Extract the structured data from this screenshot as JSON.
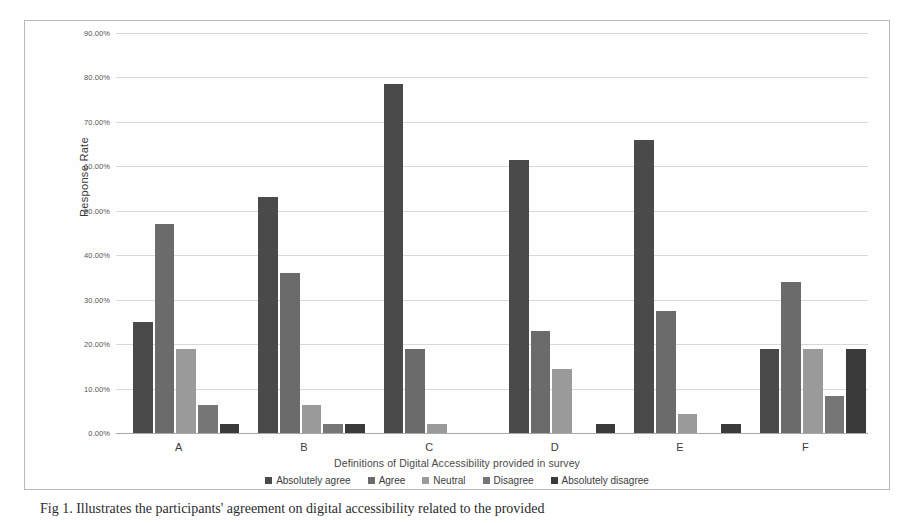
{
  "chart_data": {
    "type": "bar",
    "title": "",
    "xlabel": "Definitions of Digital Accessibility provided in survey",
    "ylabel": "Response Rate",
    "categories": [
      "A",
      "B",
      "C",
      "D",
      "E",
      "F"
    ],
    "ylim": [
      0,
      90
    ],
    "ytick_labels": [
      "0.00%",
      "10.00%",
      "20.00%",
      "30.00%",
      "40.00%",
      "50.00%",
      "60.00%",
      "70.00%",
      "80.00%",
      "90.00%"
    ],
    "ytick_values": [
      0,
      10,
      20,
      30,
      40,
      50,
      60,
      70,
      80,
      90
    ],
    "grid": true,
    "legend_position": "bottom",
    "series": [
      {
        "name": "Absolutely agree",
        "color": "#4a4a4a",
        "values": [
          25.0,
          53.0,
          78.5,
          61.5,
          66.0,
          19.0
        ]
      },
      {
        "name": "Agree",
        "color": "#6b6b6b",
        "values": [
          47.0,
          36.0,
          19.0,
          23.0,
          27.5,
          34.0
        ]
      },
      {
        "name": "Neutral",
        "color": "#9a9a9a",
        "values": [
          19.0,
          6.3,
          2.0,
          14.5,
          4.3,
          19.0
        ]
      },
      {
        "name": "Disagree",
        "color": "#767676",
        "values": [
          6.3,
          2.0,
          0,
          0,
          0,
          8.3
        ]
      },
      {
        "name": "Absolutely disagree",
        "color": "#3a3a3a",
        "values": [
          2.0,
          2.0,
          0,
          2.0,
          2.0,
          19.0
        ]
      }
    ]
  },
  "caption": {
    "text": "Fig 1. Illustrates the participants' agreement on digital accessibility related to the provided"
  },
  "colors": {
    "grid": "#d8d8d8",
    "axis": "#a8a8a8",
    "frame_border": "#b9b9b9",
    "text": "#3c3c3c",
    "background": "#ffffff"
  }
}
